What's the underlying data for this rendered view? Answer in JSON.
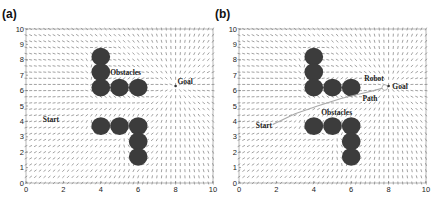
{
  "chart_data": [
    {
      "type": "quiver",
      "panel_label": "(a)",
      "title": "",
      "xlabel": "",
      "ylabel": "",
      "xlim": [
        0,
        10
      ],
      "ylim": [
        0,
        10
      ],
      "xticks": [
        0,
        2,
        4,
        6,
        8,
        10
      ],
      "yticks": [
        0,
        1,
        2,
        3,
        4,
        5,
        6,
        7,
        8,
        9,
        10
      ],
      "grid": false,
      "field": "potential field vectors toward goal, deflected around obstacles",
      "obstacles": [
        {
          "x": 4,
          "y": 8.2
        },
        {
          "x": 4,
          "y": 7.2
        },
        {
          "x": 4,
          "y": 6.2
        },
        {
          "x": 5,
          "y": 6.2
        },
        {
          "x": 6,
          "y": 6.2
        },
        {
          "x": 4,
          "y": 3.7
        },
        {
          "x": 5,
          "y": 3.7
        },
        {
          "x": 6,
          "y": 3.7
        },
        {
          "x": 6,
          "y": 2.7
        },
        {
          "x": 6,
          "y": 1.7
        }
      ],
      "obstacle_radius": 0.5,
      "start": {
        "x": 1.8,
        "y": 3.8
      },
      "goal": {
        "x": 8,
        "y": 6.3
      },
      "annotations": [
        {
          "text": "Obstacles",
          "x": 4.5,
          "y": 7.0
        },
        {
          "text": "Goal",
          "x": 8.1,
          "y": 6.4
        },
        {
          "text": "Start",
          "x": 0.9,
          "y": 3.95
        }
      ]
    },
    {
      "type": "quiver",
      "panel_label": "(b)",
      "title": "",
      "xlabel": "",
      "ylabel": "",
      "xlim": [
        0,
        10
      ],
      "ylim": [
        0,
        10
      ],
      "xticks": [
        0,
        2,
        4,
        6,
        8,
        10
      ],
      "yticks": [
        0,
        1,
        2,
        3,
        4,
        5,
        6,
        7,
        8,
        9,
        10
      ],
      "grid": false,
      "field": "potential field vectors toward goal, deflected around obstacles",
      "obstacles": [
        {
          "x": 4,
          "y": 8.2
        },
        {
          "x": 4,
          "y": 7.2
        },
        {
          "x": 4,
          "y": 6.2
        },
        {
          "x": 5,
          "y": 6.2
        },
        {
          "x": 6,
          "y": 6.2
        },
        {
          "x": 4,
          "y": 3.7
        },
        {
          "x": 5,
          "y": 3.7
        },
        {
          "x": 6,
          "y": 3.7
        },
        {
          "x": 6,
          "y": 2.7
        },
        {
          "x": 6,
          "y": 1.7
        }
      ],
      "obstacle_radius": 0.5,
      "start": {
        "x": 1.8,
        "y": 3.8
      },
      "goal": {
        "x": 8,
        "y": 6.3
      },
      "robot": {
        "x": 7.8,
        "y": 6.2
      },
      "path": [
        [
          1.8,
          3.8
        ],
        [
          3.0,
          4.5
        ],
        [
          4.2,
          5.0
        ],
        [
          5.5,
          5.5
        ],
        [
          6.5,
          5.8
        ],
        [
          7.2,
          6.0
        ],
        [
          7.8,
          6.2
        ]
      ],
      "annotations": [
        {
          "text": "Robot",
          "x": 6.7,
          "y": 6.6
        },
        {
          "text": "Goal",
          "x": 8.2,
          "y": 6.1
        },
        {
          "text": "Path",
          "x": 6.6,
          "y": 5.3
        },
        {
          "text": "Obstacles",
          "x": 4.4,
          "y": 4.4
        },
        {
          "text": "Start",
          "x": 0.9,
          "y": 3.6
        }
      ]
    }
  ]
}
